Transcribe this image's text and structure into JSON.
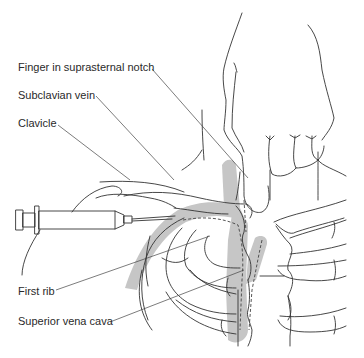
{
  "figure": {
    "colors": {
      "line": "#333333",
      "shade": "#c6c6c6",
      "background": "#ffffff"
    },
    "labels": [
      {
        "id": "finger",
        "text": "Finger in suprasternal notch"
      },
      {
        "id": "subclavian",
        "text": "Subclavian vein"
      },
      {
        "id": "clavicle",
        "text": "Clavicle"
      },
      {
        "id": "first-rib",
        "text": "First rib"
      },
      {
        "id": "svc",
        "text": "Superior vena cava"
      }
    ],
    "elements": [
      "syringe-with-needle",
      "hand-holding-syringe",
      "hand-pointing-finger",
      "clavicle",
      "subclavian-vein",
      "superior-vena-cava",
      "rib-cage",
      "sternum"
    ]
  }
}
